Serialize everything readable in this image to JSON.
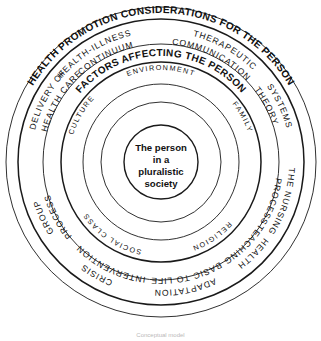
{
  "figure": {
    "type": "concentric-circle-diagram",
    "title": "Health promotion considerations for the person",
    "center_text_lines": [
      "The person",
      "in a",
      "pluralistic",
      "society"
    ],
    "caption": "Conceptual model"
  },
  "rings": {
    "outer": {
      "heading": "HEALTH PROMOTION CONSIDERATIONS FOR THE PERSON",
      "items": [
        {
          "id": "delivery-of-health-care",
          "lines": [
            "DELIVERY OF",
            "HEALTH CARE"
          ]
        },
        {
          "id": "health-illness-continuum",
          "lines": [
            "HEALTH-ILLNESS",
            "CONTINUUM"
          ]
        },
        {
          "id": "therapeutic-communication",
          "lines": [
            "THERAPEUTIC",
            "COMMUNICATION"
          ]
        },
        {
          "id": "systems-theory",
          "lines": [
            "SYSTEMS",
            "THEORY"
          ]
        },
        {
          "id": "the-nursing-process",
          "lines": [
            "THE NURSING",
            "PROCESS"
          ]
        },
        {
          "id": "health-teaching",
          "lines": [
            "HEALTH",
            "TEACHING"
          ]
        },
        {
          "id": "adaptation-basic-to-life",
          "lines": [
            "ADAPTATION",
            "BASIC TO LIFE"
          ]
        },
        {
          "id": "crisis-intervention",
          "lines": [
            "CRISIS",
            "INTERVENTION"
          ]
        },
        {
          "id": "group-process",
          "lines": [
            "GROUP",
            "PROCESS"
          ]
        }
      ]
    },
    "middle": {
      "heading": "FACTORS AFFECTING THE PERSON",
      "items": [
        {
          "id": "environment",
          "label": "ENVIRONMENT"
        },
        {
          "id": "family",
          "label": "FAMILY"
        },
        {
          "id": "religion",
          "label": "RELIGION"
        },
        {
          "id": "social-class",
          "label": "SOCIAL CLASS"
        },
        {
          "id": "culture",
          "label": "CULTURE"
        }
      ]
    }
  },
  "colors": {
    "stroke": "#1a1a1a",
    "background": "#ffffff",
    "text": "#111111",
    "caption": "#b9b9b9"
  },
  "geometry": {
    "center_x": 161,
    "center_y": 162,
    "radii": [
      155,
      143,
      118,
      100,
      78,
      60,
      37
    ]
  }
}
